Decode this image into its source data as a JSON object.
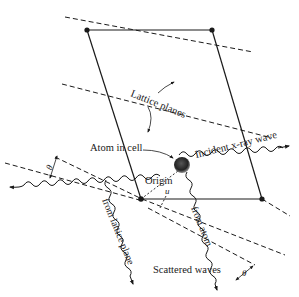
{
  "diagram": {
    "colors": {
      "ink": "#1a1a1a",
      "atom": "#2b2b2b",
      "background": "#ffffff"
    },
    "cell": {
      "corners": {
        "top_left": [
          87,
          30
        ],
        "top_right": [
          212,
          30
        ],
        "bottom_right": [
          262,
          199
        ],
        "bottom_left": [
          141,
          199
        ]
      }
    },
    "labels": {
      "lattice_planes": "Lattice planes",
      "atom_in_cell": "Atom in cell",
      "incident_wave": "Incident x-ray wave",
      "origin": "Origin",
      "u": "u",
      "from_lattice_plane": "from lattice plane",
      "from_atom": "from atom",
      "scattered_waves": "Scattered waves",
      "theta_left": "θ",
      "theta_right": "θ"
    },
    "nodes": [
      {
        "id": "corner-top-left",
        "type": "lattice-point"
      },
      {
        "id": "corner-top-right",
        "type": "lattice-point"
      },
      {
        "id": "corner-bottom-left",
        "type": "lattice-point",
        "role": "origin"
      },
      {
        "id": "corner-bottom-right",
        "type": "lattice-point"
      },
      {
        "id": "atom",
        "type": "atom"
      }
    ],
    "edges": [
      {
        "from": "corner-top-left",
        "to": "corner-top-right",
        "style": "solid"
      },
      {
        "from": "corner-top-right",
        "to": "corner-bottom-right",
        "style": "solid"
      },
      {
        "from": "corner-bottom-right",
        "to": "corner-bottom-left",
        "style": "solid"
      },
      {
        "from": "corner-bottom-left",
        "to": "corner-top-left",
        "style": "solid"
      },
      {
        "from": "corner-bottom-left",
        "to": "atom",
        "style": "dashed",
        "label": "u"
      }
    ]
  }
}
